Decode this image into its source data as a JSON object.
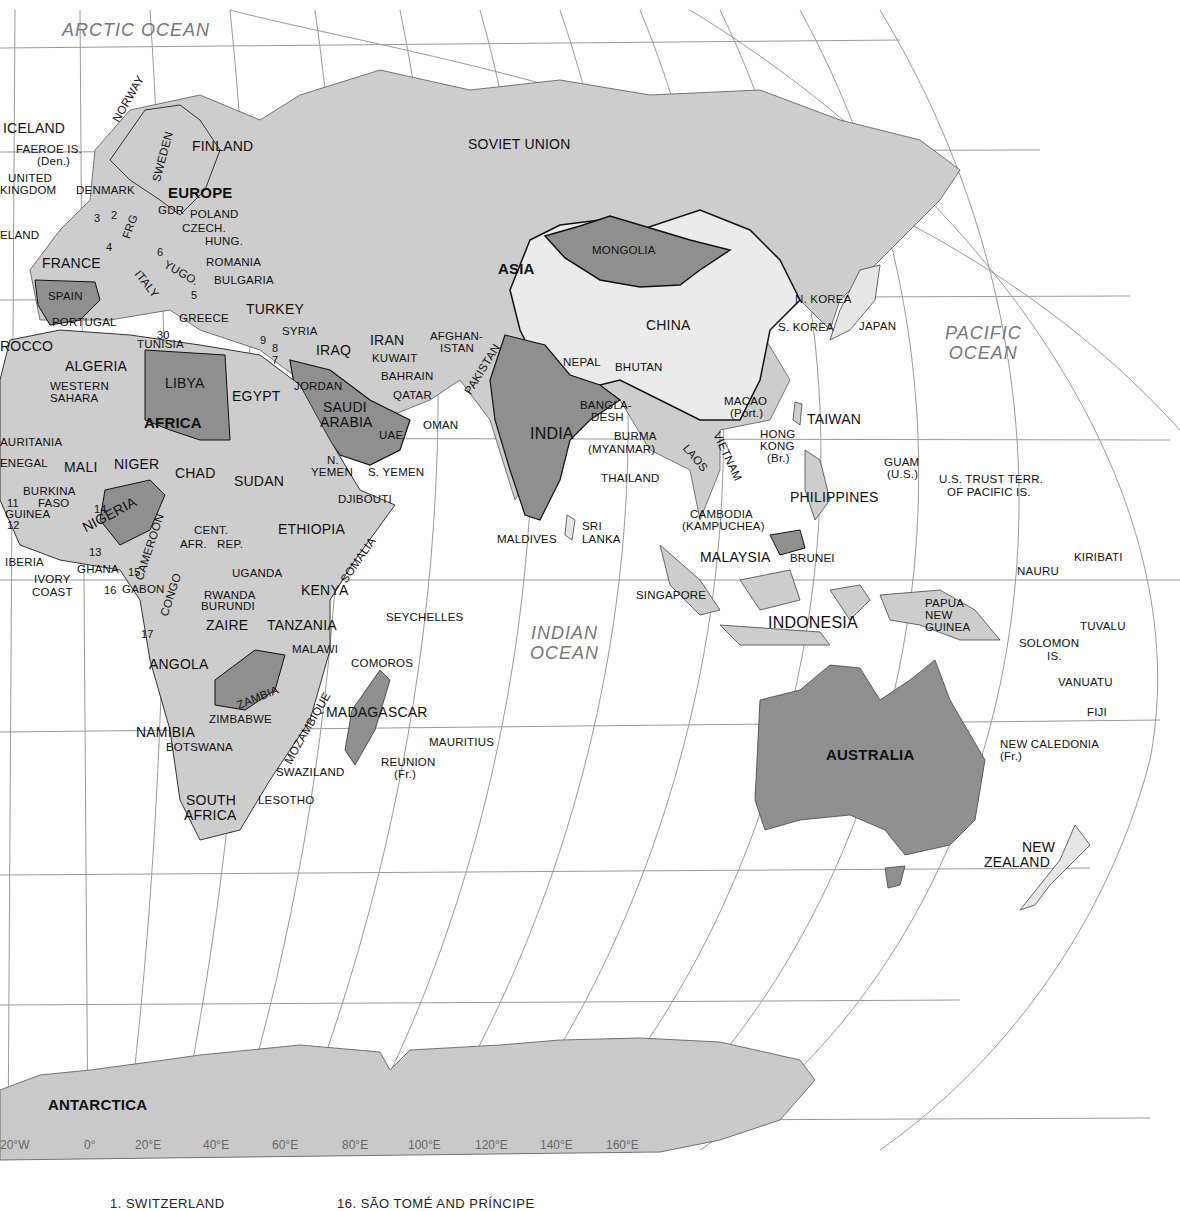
{
  "oceans": [
    {
      "name": "ARCTIC OCEAN"
    },
    {
      "name": "PACIFIC OCEAN",
      "lines": [
        "PACIFIC",
        "OCEAN"
      ]
    },
    {
      "name": "INDIAN OCEAN",
      "lines": [
        "INDIAN",
        "OCEAN"
      ]
    }
  ],
  "continents": {
    "europe": "EUROPE",
    "asia": "ASIA",
    "africa": "AFRICA",
    "australia": "AUSTRALIA",
    "antarctica": "ANTARCTICA"
  },
  "countries": {
    "europe": [
      "ICELAND",
      "FAEROE IS.",
      "(Den.)",
      "UNITED",
      "KINGDOM",
      "DENMARK",
      "IRELAND",
      "NORWAY",
      "SWEDEN",
      "FINLAND",
      "GDR",
      "POLAND",
      "CZECH.",
      "HUNG.",
      "FRG",
      "FRANCE",
      "ROMANIA",
      "YUGO.",
      "BULGARIA",
      "ITALY",
      "SPAIN",
      "PORTUGAL",
      "GREECE",
      "TURKEY"
    ],
    "asia": [
      "SOVIET UNION",
      "MONGOLIA",
      "CHINA",
      "N. KOREA",
      "S. KOREA",
      "JAPAN",
      "SYRIA",
      "IRAQ",
      "IRAN",
      "KUWAIT",
      "AFGHAN-",
      "ISTAN",
      "PAKISTAN",
      "JORDAN",
      "BAHRAIN",
      "QATAR",
      "SAUDI",
      "ARABIA",
      "UAE",
      "OMAN",
      "N.",
      "YEMEN",
      "S. YEMEN",
      "NEPAL",
      "BHUTAN",
      "INDIA",
      "BANGLA-",
      "DESH",
      "BURMA",
      "(MYANMAR)",
      "THAILAND",
      "LAOS",
      "VIETNAM",
      "CAMBODIA",
      "(KAMPUCHEA)",
      "MACAO",
      "(Port.)",
      "HONG",
      "KONG",
      "(Br.)",
      "TAIWAN",
      "PHILIPPINES",
      "MALAYSIA",
      "BRUNEI",
      "SINGAPORE",
      "INDONESIA",
      "SRI",
      "LANKA",
      "MALDIVES"
    ],
    "africa": [
      "MOROCCO",
      "ALGERIA",
      "TUNISIA",
      "LIBYA",
      "EGYPT",
      "WESTERN",
      "SAHARA",
      "MAURITANIA",
      "SENEGAL",
      "MALI",
      "NIGER",
      "CHAD",
      "SUDAN",
      "BURKINA",
      "FASO",
      "GUINEA",
      "LIBERIA",
      "IVORY",
      "COAST",
      "GHANA",
      "NIGERIA",
      "CAMEROON",
      "CENT.",
      "AFR.",
      "REP.",
      "ETHIOPIA",
      "DJIBOUTI",
      "SOMALIA",
      "UGANDA",
      "KENYA",
      "GABON",
      "CONGO",
      "RWANDA",
      "BURUNDI",
      "ZAIRE",
      "TANZANIA",
      "ANGOLA",
      "ZAMBIA",
      "MALAWI",
      "MOZAMBIQUE",
      "NAMIBIA",
      "ZIMBABWE",
      "BOTSWANA",
      "SWAZILAND",
      "SOUTH",
      "AFRICA",
      "LESOTHO",
      "MADAGASCAR",
      "COMOROS",
      "SEYCHELLES",
      "MAURITIUS",
      "REUNION",
      "(Fr.)"
    ],
    "oceania": [
      "GUAM",
      "(U.S.)",
      "U.S. TRUST TERR.",
      "OF PACIFIC IS.",
      "PAPUA",
      "NEW",
      "GUINEA",
      "NAURU",
      "KIRIBATI",
      "SOLOMON",
      "IS.",
      "TUVALU",
      "VANUATU",
      "FIJI",
      "NEW CALEDONIA",
      "(Fr.)",
      "NEW",
      "ZEALAND"
    ]
  },
  "numbers": [
    "1",
    "2",
    "3",
    "4",
    "5",
    "6",
    "7",
    "8",
    "9",
    "11",
    "12",
    "13",
    "14",
    "15",
    "16",
    "17",
    "30"
  ],
  "longitude_ticks": [
    "20°W",
    "0°",
    "20°E",
    "40°E",
    "60°E",
    "80°E",
    "100°E",
    "120°E",
    "140°E",
    "160°E"
  ],
  "legend": {
    "item1": "1. SWITZERLAND",
    "item16": "16. SÃO TOMÉ AND PRÍNCIPE"
  },
  "colors": {
    "ocean": "#ffffff",
    "land_light": "#e6e6e6",
    "land_mid": "#c6c6c6",
    "land_dark": "#8f8f8f",
    "grid": "#8a8a8a",
    "border": "#111111",
    "ocean_label": "#777777"
  }
}
